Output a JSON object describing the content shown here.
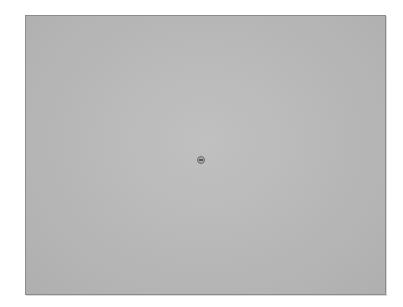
{
  "window": {
    "panel_color": "#b8b8b8",
    "border_color": "#8c8c8c"
  },
  "center": {
    "icon": "circle-button-icon"
  }
}
